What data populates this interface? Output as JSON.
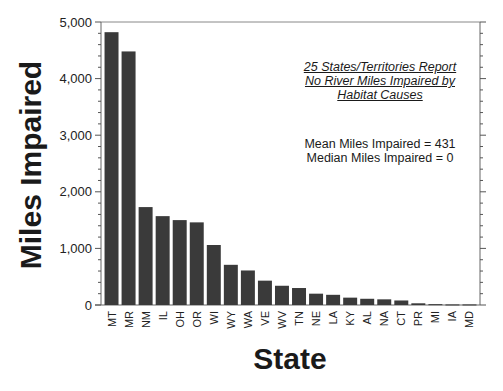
{
  "chart_data": {
    "type": "bar",
    "title": "",
    "xlabel": "State",
    "ylabel": "Miles Impaired",
    "ylim": [
      0,
      5000
    ],
    "yticks": [
      0,
      1000,
      2000,
      3000,
      4000,
      5000
    ],
    "ytick_labels": [
      "0",
      "1,000",
      "2,000",
      "3,000",
      "4,000",
      "5,000"
    ],
    "grid": false,
    "legend": null,
    "bar_color": "#3a3a3a",
    "categories": [
      "MT",
      "MR",
      "NM",
      "IL",
      "OH",
      "OR",
      "WI",
      "WY",
      "WA",
      "VE",
      "WV",
      "TN",
      "NE",
      "LA",
      "KY",
      "AL",
      "NA",
      "CT",
      "PR",
      "MI",
      "IA",
      "MD"
    ],
    "values": [
      4820,
      4480,
      1730,
      1570,
      1500,
      1460,
      1060,
      710,
      610,
      430,
      340,
      300,
      200,
      180,
      130,
      110,
      100,
      80,
      30,
      15,
      10,
      10
    ],
    "annotations": [
      "25 States/Territories Report",
      "No River Miles Impaired by",
      "Habitat Causes",
      "Mean Miles Impaired = 431",
      "Median Miles Impaired = 0"
    ]
  },
  "labels": {
    "ylabel": "Miles Impaired",
    "xlabel": "State",
    "note_line1": "25 States/Territories Report",
    "note_line2": "No River Miles Impaired by",
    "note_line3": "Habitat Causes",
    "mean": "Mean Miles Impaired = 431",
    "median": "Median Miles Impaired = 0"
  }
}
